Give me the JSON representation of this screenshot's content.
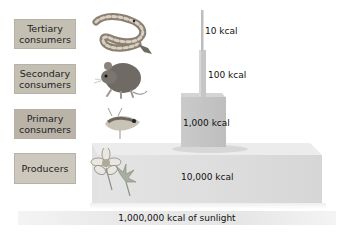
{
  "levels": [
    {
      "name": "Tertiary consumers",
      "line1": "Tertiary",
      "line2": "consumers",
      "energy": "10 kcal",
      "organism_icon": "rattlesnake-icon"
    },
    {
      "name": "Secondary consumers",
      "line1": "Secondary",
      "line2": "consumers",
      "energy": "100 kcal",
      "organism_icon": "mouse-icon"
    },
    {
      "name": "Primary consumers",
      "line1": "Primary",
      "line2": "consumers",
      "energy": "1,000 kcal",
      "organism_icon": "grasshopper-icon"
    },
    {
      "name": "Producers",
      "line1": "Producers",
      "line2": "",
      "energy": "10,000 kcal",
      "organism_icon": "flower-icon"
    }
  ],
  "sunlight": "1,000,000 kcal of sunlight",
  "colors": {
    "label_box": "#c4bfb3",
    "block_front": "#d9d9d9",
    "block_top": "#e8e8e8",
    "block_side": "#cfcfcf"
  }
}
